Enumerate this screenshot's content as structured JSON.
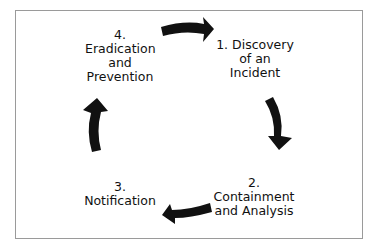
{
  "diagram": {
    "type": "cycle",
    "steps": [
      {
        "id": 1,
        "label": "1. Discovery\nof an\nIncident"
      },
      {
        "id": 2,
        "label": "2.\nContainment\nand Analysis"
      },
      {
        "id": 3,
        "label": "3.\nNotification"
      },
      {
        "id": 4,
        "label": "4.\nEradication\nand\nPrevention"
      }
    ],
    "arrow_color": "#111111",
    "direction": "clockwise"
  }
}
